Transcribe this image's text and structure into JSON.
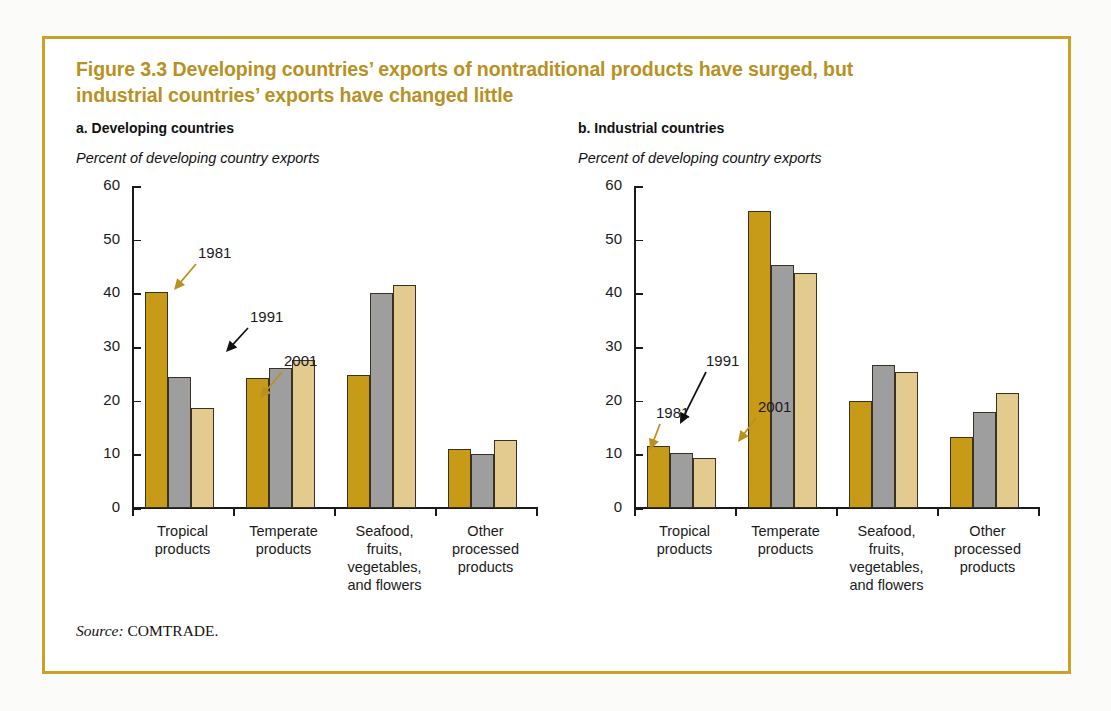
{
  "figure": {
    "title_line1": "Figure 3.3  Developing countries’ exports of nontraditional products have surged, but",
    "title_line2": "industrial countries’ exports have changed little",
    "title_color": "#b8911f",
    "frame_color": "#c9a227",
    "source_label": "Source:",
    "source_text": "COMTRADE."
  },
  "series_colors": {
    "1981": "#c79a17",
    "1991": "#9e9e9e",
    "2001": "#e3ca8e"
  },
  "annotations": {
    "a": [
      {
        "label": "1981",
        "color": "#b8911f"
      },
      {
        "label": "1991",
        "color": "#111111"
      },
      {
        "label": "2001",
        "color": "#b8911f"
      }
    ],
    "b": [
      {
        "label": "1981",
        "color": "#b8911f"
      },
      {
        "label": "1991",
        "color": "#111111"
      },
      {
        "label": "2001",
        "color": "#b8911f"
      }
    ]
  },
  "chart_data": [
    {
      "type": "bar",
      "panel": "a",
      "title": "a. Developing countries",
      "ylabel": "Percent of developing country exports",
      "xlabel": "",
      "ylim": [
        0,
        60
      ],
      "yticks": [
        0,
        10,
        20,
        30,
        40,
        50,
        60
      ],
      "grid": false,
      "legend": "annotated arrows",
      "categories": [
        "Tropical\nproducts",
        "Temperate\nproducts",
        "Seafood,\nfruits,\nvegetables,\nand flowers",
        "Other\nprocessed\nproducts"
      ],
      "series": [
        {
          "name": "1981",
          "values": [
            40.2,
            24.3,
            24.8,
            11.0
          ]
        },
        {
          "name": "1991",
          "values": [
            24.4,
            26.1,
            40.0,
            10.0
          ]
        },
        {
          "name": "2001",
          "values": [
            18.7,
            27.6,
            41.5,
            12.6
          ]
        }
      ]
    },
    {
      "type": "bar",
      "panel": "b",
      "title": "b. Industrial countries",
      "ylabel": "Percent of developing country exports",
      "xlabel": "",
      "ylim": [
        0,
        60
      ],
      "yticks": [
        0,
        10,
        20,
        30,
        40,
        50,
        60
      ],
      "grid": false,
      "legend": "annotated arrows",
      "categories": [
        "Tropical\nproducts",
        "Temperate\nproducts",
        "Seafood,\nfruits,\nvegetables,\nand flowers",
        "Other\nprocessed\nproducts"
      ],
      "series": [
        {
          "name": "1981",
          "values": [
            11.5,
            55.3,
            20.0,
            13.3
          ]
        },
        {
          "name": "1991",
          "values": [
            10.3,
            45.2,
            26.6,
            17.9
          ]
        },
        {
          "name": "2001",
          "values": [
            9.4,
            43.8,
            25.3,
            21.4
          ]
        }
      ]
    }
  ]
}
